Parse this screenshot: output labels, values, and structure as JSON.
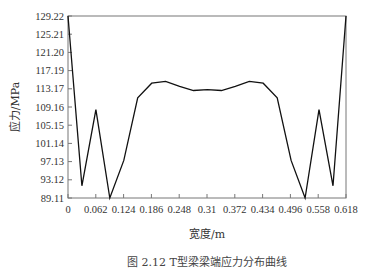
{
  "chart_data": {
    "type": "line",
    "title": "",
    "caption": "图 2.12  T型梁梁端应力分布曲线",
    "xlabel": "宽度/m",
    "ylabel": "应力/MPa",
    "xlim": [
      0,
      0.618
    ],
    "ylim": [
      89.11,
      129.22
    ],
    "xticks": [
      "0",
      "0.062",
      "0.124",
      "0.186",
      "0.248",
      "0.31",
      "0.372",
      "0.434",
      "0.496",
      "0.558",
      "0.618"
    ],
    "yticks": [
      "89.11",
      "93.12",
      "97.13",
      "101.14",
      "105.15",
      "109.16",
      "113.17",
      "117.19",
      "121.20",
      "125.21",
      "129.22"
    ],
    "grid": false,
    "legend": null,
    "series": [
      {
        "name": "应力",
        "x": [
          0,
          0.031,
          0.062,
          0.093,
          0.124,
          0.155,
          0.186,
          0.217,
          0.248,
          0.279,
          0.31,
          0.341,
          0.372,
          0.403,
          0.434,
          0.465,
          0.496,
          0.527,
          0.558,
          0.589,
          0.618
        ],
        "y": [
          129.22,
          91.8,
          108.6,
          89.1,
          97.4,
          111.2,
          114.4,
          114.8,
          113.7,
          112.8,
          113.0,
          112.8,
          113.7,
          114.8,
          114.4,
          111.2,
          97.4,
          89.1,
          108.6,
          91.8,
          129.22
        ]
      }
    ]
  }
}
